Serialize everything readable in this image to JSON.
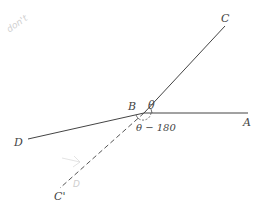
{
  "diagram": {
    "points": {
      "A": {
        "label": "A"
      },
      "B": {
        "label": "B"
      },
      "C": {
        "label": "C"
      },
      "C_prime": {
        "label": "C'"
      },
      "D": {
        "label": "D"
      }
    },
    "angles": {
      "theta": "θ",
      "theta_minus_180": "θ − 180"
    },
    "handwritten": {
      "top_left_watermark": "don't",
      "near_c_prime": "D"
    },
    "colors": {
      "line": "#444444",
      "dashed": "#555555",
      "handwriting": "#cfcfcf"
    }
  }
}
